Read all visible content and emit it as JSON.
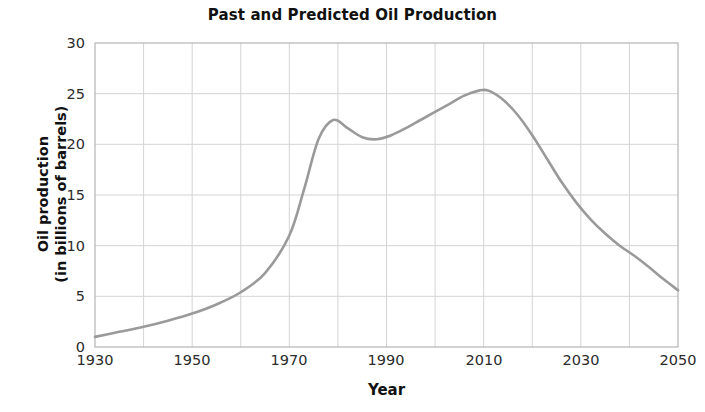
{
  "chart_data": {
    "type": "line",
    "title": "Past and Predicted Oil Production",
    "xlabel": "Year",
    "ylabel_line1": "Oil production",
    "ylabel_line2": "(in billions of barrels)",
    "ylabel": "Oil production (in billions of barrels)",
    "xlim": [
      1930,
      2050
    ],
    "ylim": [
      0,
      30
    ],
    "xticks": [
      1930,
      1950,
      1970,
      1990,
      2010,
      2030,
      2050
    ],
    "xtick_labels": [
      "1930",
      "1950",
      "1970",
      "1990",
      "2010",
      "2030",
      "2050"
    ],
    "yticks": [
      0,
      5,
      10,
      15,
      20,
      25,
      30
    ],
    "ytick_labels": [
      "0",
      "5",
      "10",
      "15",
      "20",
      "25",
      "30"
    ],
    "grid": true,
    "grid_x_step": 10,
    "grid_y_step": 5,
    "legend": null,
    "line_color": "#9a9a9a",
    "series": [
      {
        "name": "Oil production",
        "x": [
          1930,
          1935,
          1940,
          1945,
          1950,
          1955,
          1960,
          1965,
          1970,
          1973,
          1976,
          1979,
          1982,
          1985,
          1988,
          1991,
          1994,
          1997,
          2000,
          2003,
          2006,
          2009,
          2011,
          2014,
          2017,
          2020,
          2023,
          2026,
          2029,
          2032,
          2035,
          2038,
          2041,
          2044,
          2047,
          2050
        ],
        "values": [
          1.0,
          1.5,
          2.0,
          2.6,
          3.3,
          4.2,
          5.4,
          7.3,
          11.0,
          15.5,
          20.5,
          22.4,
          21.6,
          20.7,
          20.5,
          20.9,
          21.6,
          22.4,
          23.2,
          24.0,
          24.8,
          25.3,
          25.3,
          24.4,
          22.9,
          20.9,
          18.6,
          16.3,
          14.3,
          12.6,
          11.2,
          10.0,
          9.0,
          7.9,
          6.7,
          5.6
        ]
      }
    ],
    "annotations": {
      "local_max_1979": 22.4,
      "local_min_1988": 20.5,
      "global_max_2010": 25.3,
      "start_1930": 1.0,
      "end_2050": 5.6
    }
  },
  "axes": {
    "plot_left_px": 95,
    "plot_top_px": 43,
    "plot_width_px": 583,
    "plot_height_px": 304
  }
}
